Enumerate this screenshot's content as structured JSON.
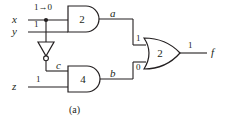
{
  "figure": {
    "caption": "(a)",
    "stroke_color": "#231f20",
    "background": "#ffffff"
  },
  "inputs": [
    {
      "name": "x",
      "value": "1→0",
      "label_name": "input-label-x",
      "value_name": "input-value-x"
    },
    {
      "name": "y",
      "value": "1",
      "label_name": "input-label-y",
      "value_name": "input-value-y"
    },
    {
      "name": "z",
      "value": "1",
      "label_name": "input-label-z",
      "value_name": "input-value-z"
    }
  ],
  "gates": [
    {
      "id": "and2",
      "type": "AND",
      "number": "2",
      "output_signal": "a",
      "output_value": "1"
    },
    {
      "id": "and4",
      "type": "AND",
      "number": "4",
      "output_signal": "b",
      "output_value": "0"
    },
    {
      "id": "or2",
      "type": "OR",
      "number": "2",
      "output_signal": "f",
      "output_value": "1"
    },
    {
      "id": "inv",
      "type": "NOT",
      "number": "",
      "output_signal": "c",
      "output_value": ""
    }
  ],
  "nets": {
    "a_label": "a",
    "b_label": "b",
    "c_label": "c",
    "f_label": "f",
    "or_input_top_value": "1",
    "or_input_bottom_value": "0",
    "f_value": "1"
  }
}
